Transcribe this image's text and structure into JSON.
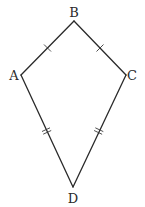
{
  "diagram": {
    "type": "kite",
    "vertices": {
      "A": {
        "label": "A",
        "x": 21,
        "y": 75
      },
      "B": {
        "label": "B",
        "x": 74,
        "y": 21
      },
      "C": {
        "label": "C",
        "x": 126,
        "y": 75
      },
      "D": {
        "label": "D",
        "x": 73,
        "y": 187
      }
    },
    "edges": [
      {
        "from": "A",
        "to": "B",
        "tick_marks": 1
      },
      {
        "from": "B",
        "to": "C",
        "tick_marks": 1
      },
      {
        "from": "C",
        "to": "D",
        "tick_marks": 2
      },
      {
        "from": "D",
        "to": "A",
        "tick_marks": 2
      }
    ],
    "stroke_color": "#2a2a2a",
    "background_color": "#ffffff"
  }
}
